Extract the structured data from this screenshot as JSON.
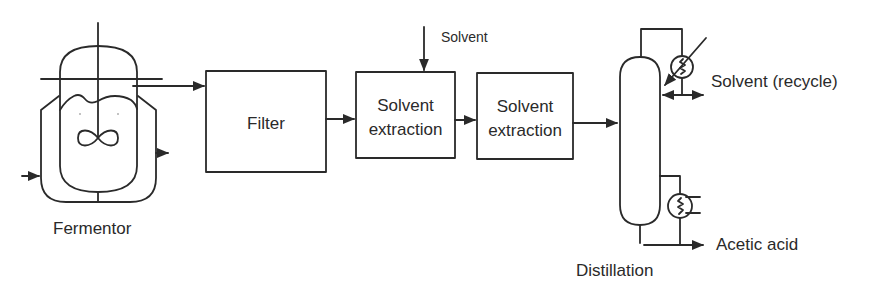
{
  "diagram": {
    "colors": {
      "stroke": "#2a2a2a",
      "background": "#ffffff",
      "text": "#2a2a2a"
    },
    "units": {
      "fermentor": {
        "label": "Fermentor"
      },
      "filter": {
        "label": "Filter"
      },
      "extraction_1": {
        "line1": "Solvent",
        "line2": "extraction"
      },
      "extraction_2": {
        "line1": "Solvent",
        "line2": "extraction"
      },
      "distillation": {
        "label": "Distillation"
      }
    },
    "streams": {
      "solvent_feed": {
        "label": "Solvent"
      },
      "solvent_recycle": {
        "label": "Solvent (recycle)"
      },
      "product": {
        "label": "Acetic acid"
      }
    },
    "icons": [
      "fermentor-vessel-icon",
      "impeller-icon",
      "cooling-jacket-icon",
      "condenser-icon",
      "reboiler-icon",
      "distillation-column-icon",
      "flow-arrow-icon"
    ]
  }
}
